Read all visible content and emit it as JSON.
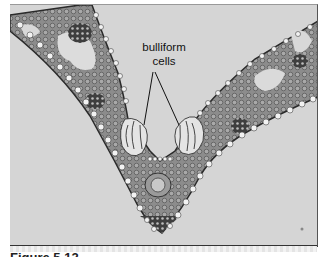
{
  "figure": {
    "type": "micrograph-illustration",
    "annotation": {
      "line1": "bulliform",
      "line2": "cells"
    },
    "caption": "Figure 5.12",
    "colors": {
      "background": "#d5d5d5",
      "tissue": "#8a8a8a",
      "tissue_dark": "#4a4a4a",
      "epidermis_cells": "#f0f0f0",
      "bulliform_fill": "#e2e2e2",
      "frame_border": "#333333"
    }
  }
}
